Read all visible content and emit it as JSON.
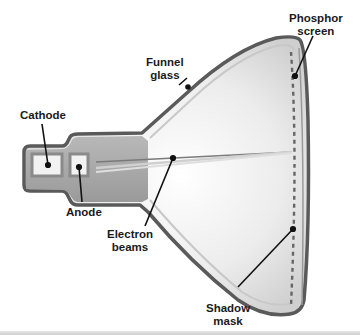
{
  "diagram": {
    "labels": {
      "cathode": "Cathode",
      "anode": "Anode",
      "funnel_glass_line1": "Funnel",
      "funnel_glass_line2": "glass",
      "phosphor_screen_line1": "Phosphor",
      "phosphor_screen_line2": "screen",
      "electron_beams_line1": "Electron",
      "electron_beams_line2": "beams",
      "shadow_mask_line1": "Shadow",
      "shadow_mask_line2": "mask"
    },
    "colors": {
      "outline": "#5a5a5a",
      "neck_fill": "#a8a8a8",
      "funnel_fill": "#e4e4e4",
      "leader_line": "#111111",
      "background": "#ffffff"
    }
  }
}
